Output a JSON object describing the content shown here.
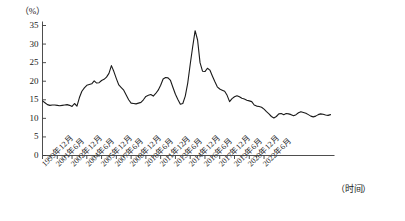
{
  "axes": {
    "y_unit": "（%）",
    "x_unit": "（时间）",
    "y_ticks": [
      "35",
      "30",
      "25",
      "20",
      "15",
      "10",
      "5",
      "0"
    ],
    "x_ticks": [
      "1999年12月",
      "2001年6月",
      "2002年12月",
      "2004年6月",
      "2005年12月",
      "2007年6月",
      "2008年12月",
      "2010年6月",
      "2011年12月",
      "2013年6月",
      "2014年12月",
      "2016年6月",
      "2017年12月",
      "2019年6月",
      "2020年12月",
      "2022年6月"
    ]
  },
  "style": {
    "line_color": "#1a1a1a",
    "axis_color": "#3a3a3a",
    "background": "#ffffff"
  },
  "chart_data": {
    "type": "line",
    "title": "",
    "subtitle": "",
    "xlabel": "（时间）",
    "ylabel": "（%）",
    "ylim": [
      0,
      35
    ],
    "ytick_values": [
      0,
      5,
      10,
      15,
      20,
      25,
      30,
      35
    ],
    "grid": false,
    "legend": null,
    "x_tick_labels": [
      "1999年12月",
      "2001年6月",
      "2002年12月",
      "2004年6月",
      "2005年12月",
      "2007年6月",
      "2008年12月",
      "2010年6月",
      "2011年12月",
      "2013年6月",
      "2014年12月",
      "2016年6月",
      "2017年12月",
      "2019年6月",
      "2020年12月",
      "2022年6月"
    ],
    "x_tick_positions_months": [
      0,
      18,
      36,
      54,
      72,
      90,
      108,
      126,
      144,
      162,
      180,
      198,
      216,
      234,
      252,
      270
    ],
    "x_start": "1999年12月",
    "x_end": "2023年6月",
    "x_step_months": 3,
    "series": [
      {
        "name": "同比增速",
        "values": [
          14.7,
          14.2,
          13.7,
          13.5,
          13.6,
          13.6,
          13.5,
          13.4,
          13.5,
          13.6,
          13.7,
          13.5,
          13.2,
          14.0,
          13.3,
          15.6,
          17.3,
          18.2,
          18.9,
          19.1,
          19.3,
          20.1,
          19.5,
          19.6,
          20.2,
          20.5,
          21.1,
          22.1,
          24.2,
          22.6,
          20.7,
          19.0,
          18.3,
          17.6,
          16.3,
          15.0,
          14.1,
          14.0,
          13.9,
          14.1,
          14.3,
          15.0,
          15.9,
          16.2,
          16.4,
          16.0,
          16.7,
          17.6,
          18.9,
          20.6,
          21.0,
          20.9,
          20.2,
          18.3,
          16.5,
          15.1,
          13.8,
          14.0,
          16.0,
          19.5,
          24.5,
          29.2,
          33.6,
          31.1,
          25.0,
          22.7,
          22.6,
          23.5,
          23.0,
          21.4,
          19.9,
          18.5,
          17.9,
          17.6,
          17.3,
          16.2,
          14.5,
          15.3,
          15.8,
          16.1,
          15.8,
          15.4,
          15.2,
          14.9,
          14.7,
          14.5,
          13.6,
          13.3,
          13.2,
          13.0,
          12.5,
          11.8,
          11.2,
          10.5,
          10.1,
          10.5,
          11.2,
          11.3,
          11.0,
          11.3,
          11.2,
          11.0,
          10.7,
          11.0,
          11.5,
          11.8,
          11.6,
          11.4,
          11.0,
          10.6,
          10.4,
          10.6,
          11.0,
          11.2,
          11.1,
          10.9,
          10.8,
          11.0
        ]
      }
    ],
    "annotations": [],
    "max_value": 33.6,
    "min_value": 10.1,
    "first_value": 14.7,
    "last_value": 11.0
  }
}
